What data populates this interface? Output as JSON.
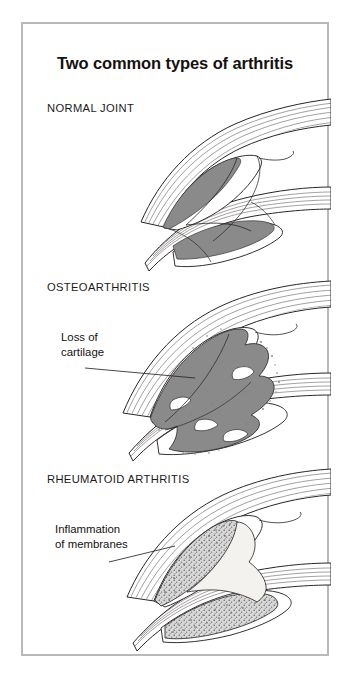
{
  "figure": {
    "title": "Two common types of arthritis",
    "border_color": "#b9b9b9",
    "background_color": "#ffffff",
    "ink_color": "#1c1a19",
    "cartilage_gray": "#8a8a8a",
    "stipple_gray": "#9a9a9a"
  },
  "panels": [
    {
      "id": "normal",
      "heading": "NORMAL JOINT",
      "callout": null
    },
    {
      "id": "osteoarthritis",
      "heading": "OSTEOARTHRITIS",
      "callout": {
        "line1": "Loss of",
        "line2": "cartilage"
      }
    },
    {
      "id": "rheumatoid",
      "heading": "RHEUMATOID ARTHRITIS",
      "callout": {
        "line1": "Inflammation",
        "line2": "of membranes"
      }
    }
  ]
}
